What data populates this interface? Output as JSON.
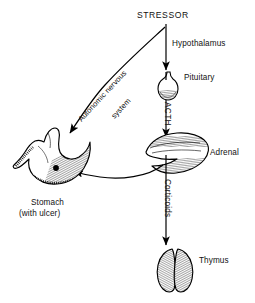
{
  "figure": {
    "title": "STRESSOR",
    "background_color": "#ffffff",
    "ink_color": "#000000"
  },
  "nodes": {
    "stressor": {
      "label": "STRESSOR"
    },
    "hypothalamus": {
      "label": "Hypothalamus"
    },
    "pituitary": {
      "label": "Pituitary"
    },
    "adrenal": {
      "label": "Adrenal"
    },
    "thymus": {
      "label": "Thymus"
    },
    "stomach": {
      "label_line1": "Stomach",
      "label_line2": "(with ulcer)"
    }
  },
  "pathways": {
    "acth": {
      "label": "ACTH"
    },
    "corticoids": {
      "label": "Corticoids"
    },
    "autonomic": {
      "label_line1": "Autonomic nervous",
      "label_line2": "system"
    }
  },
  "icons": {
    "pituitary_gland": "pituitary-gland-icon",
    "adrenal_gland": "adrenal-gland-icon",
    "thymus_gland": "thymus-gland-icon",
    "stomach_organ": "stomach-icon",
    "ulcer_marker": "ulcer-dot-icon"
  }
}
